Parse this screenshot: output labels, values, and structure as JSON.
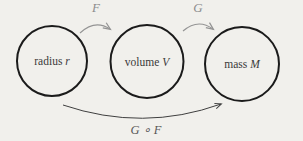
{
  "diagram": {
    "background_color": "#f1f0ec",
    "circle_stroke_color": "#1b1b1b",
    "top_arrow_color": "#949494",
    "bottom_arrow_color": "#3f3f3f",
    "node_text_color": "#3a3a3a",
    "nodes": [
      {
        "word": "radius ",
        "variable": "r"
      },
      {
        "word": "volume ",
        "variable": "V"
      },
      {
        "word": "mass ",
        "variable": "M"
      }
    ],
    "arrows": {
      "f_label": "F",
      "g_label": "G",
      "composite_label": "G ∘ F"
    }
  }
}
